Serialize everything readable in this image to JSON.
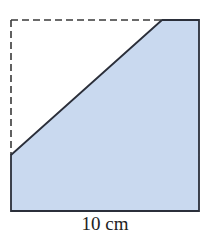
{
  "diagram": {
    "type": "geometry-figure",
    "square": {
      "outline_style": "dashed for removed corner",
      "corners": {
        "top_left": [
          11,
          20
        ],
        "top_right": [
          199,
          20
        ],
        "bottom_right": [
          199,
          211
        ],
        "bottom_left": [
          11,
          211
        ]
      }
    },
    "cut_line": {
      "from": [
        11,
        155
      ],
      "to": [
        162,
        20
      ]
    },
    "shaded_region": {
      "points": [
        [
          11,
          155
        ],
        [
          162,
          20
        ],
        [
          199,
          20
        ],
        [
          199,
          211
        ],
        [
          11,
          211
        ]
      ],
      "fill_color": "#c9d9ef",
      "stroke_color": "#2b2f3a"
    },
    "dashed_color": "#3a3a3a",
    "dimension_label": "10 cm"
  }
}
